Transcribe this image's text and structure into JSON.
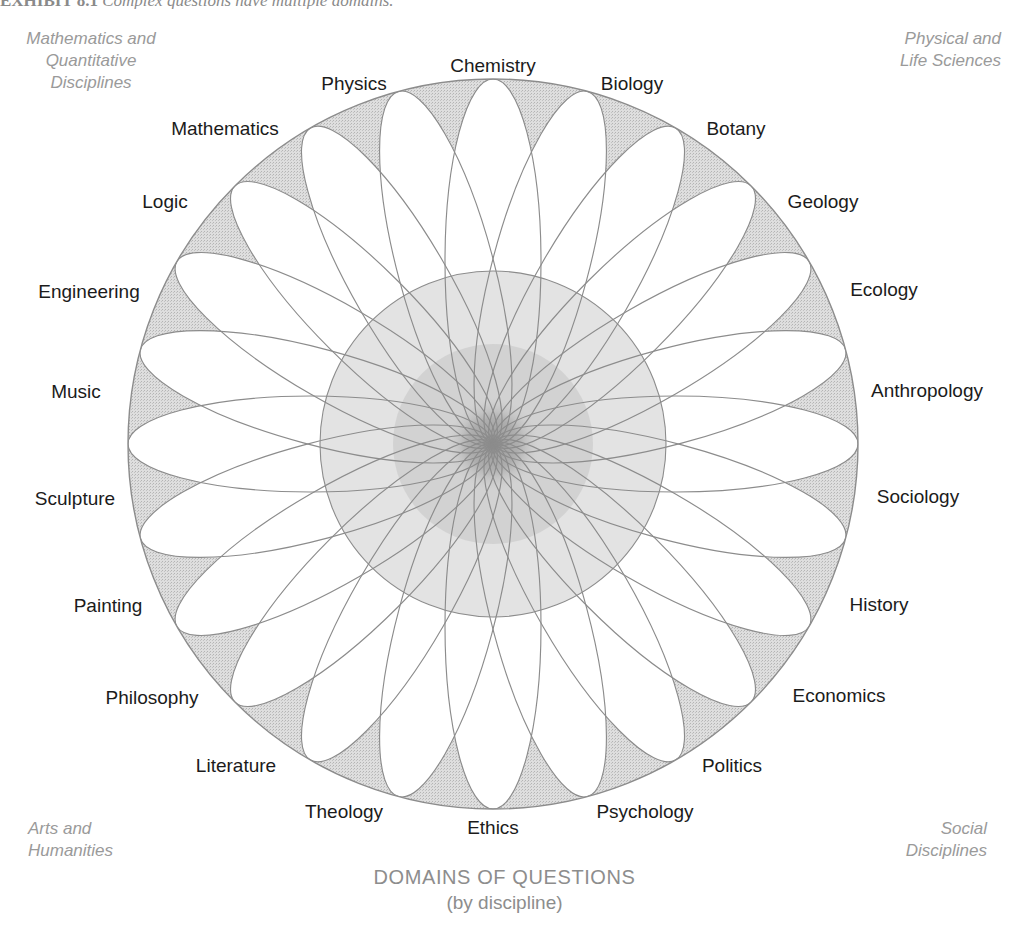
{
  "exhibit": {
    "label": "EXHIBIT 8.1",
    "title": "Complex questions have multiple domains."
  },
  "quadrants": {
    "top_left": "Mathematics and\nQuantitative\nDisciplines",
    "top_right": "Physical and\nLife Sciences",
    "bottom_left": "Arts and\nHumanities",
    "bottom_right": "Social\nDisciplines"
  },
  "caption": {
    "line1": "DOMAINS OF QUESTIONS",
    "line2": "(by discipline)"
  },
  "colors": {
    "line": "#8c8c8c",
    "petal_fill": "#ffffff",
    "outer_shade": "#d9d9d9",
    "inner_shade": "#cfcfcf",
    "label_text": "#1b1b1b",
    "caption_text": "#8d8d8d",
    "quadrant_text": "#9a9a9a"
  },
  "figure": {
    "type": "radial-rosette",
    "center_x": 493,
    "center_y": 444,
    "outer_radius": 365,
    "inner_shaded_radius": 173,
    "petal_count": 24,
    "petal_half_width": 48
  },
  "disciplines": [
    {
      "label": "Chemistry",
      "angle_deg": 0,
      "label_radius": 399,
      "group": "physical-life-sciences"
    },
    {
      "label": "Biology",
      "angle_deg": 15,
      "label_radius": 399,
      "group": "physical-life-sciences"
    },
    {
      "label": "Botany",
      "angle_deg": 30,
      "label_radius": 400,
      "group": "physical-life-sciences"
    },
    {
      "label": "Geology",
      "angle_deg": 45,
      "label_radius": 405,
      "group": "physical-life-sciences"
    },
    {
      "label": "Ecology",
      "angle_deg": 60,
      "label_radius": 403,
      "group": "physical-life-sciences"
    },
    {
      "label": "Anthropology",
      "angle_deg": 75,
      "label_radius": 419,
      "group": "social-disciplines"
    },
    {
      "label": "Sociology",
      "angle_deg": 90,
      "label_radius": 412,
      "group": "social-disciplines"
    },
    {
      "label": "History",
      "angle_deg": 105,
      "label_radius": 400,
      "group": "social-disciplines"
    },
    {
      "label": "Economics",
      "angle_deg": 120,
      "label_radius": 408,
      "group": "social-disciplines"
    },
    {
      "label": "Politics",
      "angle_deg": 135,
      "label_radius": 400,
      "group": "social-disciplines"
    },
    {
      "label": "Psychology",
      "angle_deg": 150,
      "label_radius": 403,
      "group": "social-disciplines"
    },
    {
      "label": "Ethics",
      "angle_deg": 165,
      "label_radius": 396,
      "group": "arts-humanities"
    },
    {
      "label": "Theology",
      "angle_deg": 180,
      "label_radius": 396,
      "group": "arts-humanities"
    },
    {
      "label": "Literature",
      "angle_deg": 195,
      "label_radius": 398,
      "group": "arts-humanities"
    },
    {
      "label": "Philosophy",
      "angle_deg": 210,
      "label_radius": 403,
      "group": "arts-humanities"
    },
    {
      "label": "Painting",
      "angle_deg": 225,
      "label_radius": 397,
      "group": "arts-humanities"
    },
    {
      "label": "Sculpture",
      "angle_deg": 240,
      "label_radius": 404,
      "group": "arts-humanities"
    },
    {
      "label": "Music",
      "angle_deg": 255,
      "label_radius": 400,
      "group": "arts-humanities"
    },
    {
      "label": "Engineering",
      "angle_deg": 270,
      "label_radius": 412,
      "group": "math-quantitative"
    },
    {
      "label": "Logic",
      "angle_deg": 285,
      "label_radius": 398,
      "group": "math-quantitative"
    },
    {
      "label": "Mathematics",
      "angle_deg": 300,
      "label_radius": 409,
      "group": "math-quantitative"
    },
    {
      "label": "Physics",
      "angle_deg": 315,
      "label_radius": 400,
      "group": "math-quantitative"
    },
    {
      "label": "Logic2",
      "angle_deg": 330,
      "label_radius": 398,
      "group": "hidden"
    },
    {
      "label": "Physics2",
      "angle_deg": 345,
      "label_radius": 398,
      "group": "hidden"
    }
  ],
  "visible_disciplines": [
    {
      "label": "Chemistry",
      "x": 493,
      "y": 66
    },
    {
      "label": "Biology",
      "x": 632,
      "y": 84
    },
    {
      "label": "Botany",
      "x": 736,
      "y": 129
    },
    {
      "label": "Geology",
      "x": 823,
      "y": 202
    },
    {
      "label": "Ecology",
      "x": 884,
      "y": 290
    },
    {
      "label": "Anthropology",
      "x": 927,
      "y": 391
    },
    {
      "label": "Sociology",
      "x": 918,
      "y": 497
    },
    {
      "label": "History",
      "x": 879,
      "y": 605
    },
    {
      "label": "Economics",
      "x": 839,
      "y": 696
    },
    {
      "label": "Politics",
      "x": 732,
      "y": 766
    },
    {
      "label": "Psychology",
      "x": 645,
      "y": 812
    },
    {
      "label": "Ethics",
      "x": 493,
      "y": 828
    },
    {
      "label": "Theology",
      "x": 344,
      "y": 812
    },
    {
      "label": "Literature",
      "x": 236,
      "y": 766
    },
    {
      "label": "Philosophy",
      "x": 152,
      "y": 698
    },
    {
      "label": "Painting",
      "x": 108,
      "y": 606
    },
    {
      "label": "Sculpture",
      "x": 75,
      "y": 499
    },
    {
      "label": "Music",
      "x": 76,
      "y": 392
    },
    {
      "label": "Engineering",
      "x": 89,
      "y": 292
    },
    {
      "label": "Logic",
      "x": 165,
      "y": 202
    },
    {
      "label": "Mathematics",
      "x": 225,
      "y": 129
    },
    {
      "label": "Physics",
      "x": 354,
      "y": 84
    }
  ]
}
